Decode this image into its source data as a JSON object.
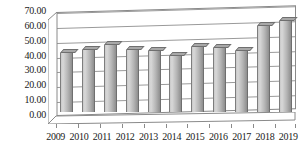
{
  "chart_data": {
    "type": "bar",
    "title": "",
    "subtitle": "",
    "xlabel": "",
    "ylabel": "",
    "categories": [
      "2009",
      "2010",
      "2011",
      "2012",
      "2013",
      "2014",
      "2015",
      "2016",
      "2017",
      "2018",
      "2019"
    ],
    "values": [
      40.0,
      42.0,
      45.0,
      42.0,
      41.0,
      38.0,
      43.5,
      43.0,
      41.0,
      58.0,
      61.0
    ],
    "series": [
      {
        "name": "Series 1",
        "values": [
          40.0,
          42.0,
          45.0,
          42.0,
          41.0,
          38.0,
          43.5,
          43.0,
          41.0,
          58.0,
          61.0
        ]
      }
    ],
    "ylim": [
      0,
      70
    ],
    "ytick_step": 10,
    "ytick_labels": [
      "0.00",
      "10.00",
      "20.00",
      "30.00",
      "40.00",
      "50.00",
      "60.00",
      "70.00"
    ],
    "ytick_values": [
      0,
      10,
      20,
      30,
      40,
      50,
      60,
      70
    ],
    "xtick_labels": [
      "2009",
      "2010",
      "2011",
      "2012",
      "2013",
      "2014",
      "2015",
      "2016",
      "2017",
      "2018",
      "2019"
    ],
    "grid": true,
    "grid_axis": "y",
    "legend": false,
    "legend_position": "none",
    "annotations": [],
    "style": {
      "three_d": true,
      "bar_fill_light": "#d8d8d8",
      "bar_fill_dark": "#8e8e8e",
      "bar_outline": "#6f6f6f",
      "gridline_color": "#9a9a9a",
      "axis_color": "#8a8a8a",
      "text_color": "#1a1a1a",
      "background": "#ffffff"
    }
  }
}
